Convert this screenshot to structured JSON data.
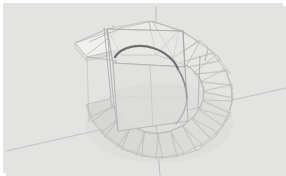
{
  "app": {
    "title": "3D Model Viewport",
    "view_label": "Spiral Staircase",
    "projection": "perspective",
    "shading": "shaded-wireframe"
  },
  "canvas": {
    "width": 286,
    "height": 176,
    "background_color": "#e3e3e1",
    "frame_color": "#ffffff",
    "frame_width": 3
  },
  "palette": {
    "tread_fill_light": "#ebebe9",
    "tread_fill_mid": "#e0e0de",
    "tread_fill_shadow": "#d6d6d4",
    "tread_edge": "#b9b9b7",
    "wireframe": "#a9a9ab",
    "wireframe_faint": "#c6c6c6",
    "axis_line": "#b4b4b6",
    "ground_line": "#bdbdbf",
    "handrail_dark": "#6e6e70"
  },
  "model": {
    "name": "helical-stair",
    "center_x": 152,
    "center_y": 82,
    "inner_radius": 34,
    "outer_radius": 84,
    "tread_count": 17,
    "start_angle_deg": -168,
    "sweep_deg": 330,
    "treads": [
      {
        "index": 1,
        "angle_deg": -170,
        "label": "tread-01",
        "fill": "#eeeeec"
      },
      {
        "index": 2,
        "angle_deg": -150,
        "label": "tread-02",
        "fill": "#ecece9"
      },
      {
        "index": 3,
        "angle_deg": -131,
        "label": "tread-03",
        "fill": "#ebebe8"
      },
      {
        "index": 4,
        "angle_deg": -112,
        "label": "tread-04",
        "fill": "#eaeae7"
      },
      {
        "index": 5,
        "angle_deg": -93,
        "label": "tread-05",
        "fill": "#e9e9e6"
      },
      {
        "index": 6,
        "angle_deg": -74,
        "label": "tread-06",
        "fill": "#e8e8e5"
      },
      {
        "index": 7,
        "angle_deg": -55,
        "label": "tread-07",
        "fill": "#e6e6e3"
      },
      {
        "index": 8,
        "angle_deg": -36,
        "label": "tread-08",
        "fill": "#e5e5e2"
      },
      {
        "index": 9,
        "angle_deg": -17,
        "label": "tread-09",
        "fill": "#e4e4e1"
      },
      {
        "index": 10,
        "angle_deg": 2,
        "label": "tread-10",
        "fill": "#e3e3e0"
      },
      {
        "index": 11,
        "angle_deg": 21,
        "label": "tread-11",
        "fill": "#e2e2df"
      },
      {
        "index": 12,
        "angle_deg": 40,
        "label": "tread-12",
        "fill": "#e1e1de"
      },
      {
        "index": 13,
        "angle_deg": 59,
        "label": "tread-13",
        "fill": "#e0e0dd"
      },
      {
        "index": 14,
        "angle_deg": 78,
        "label": "tread-14",
        "fill": "#dfdfdc"
      },
      {
        "index": 15,
        "angle_deg": 97,
        "label": "tread-15",
        "fill": "#dededb"
      },
      {
        "index": 16,
        "angle_deg": 116,
        "label": "tread-16",
        "fill": "#dddddA"
      },
      {
        "index": 17,
        "angle_deg": 135,
        "label": "tread-17",
        "fill": "#dcdcd9"
      }
    ],
    "column": {
      "name": "central-column",
      "radius": 32,
      "top_y": 52,
      "bottom_y": 118
    },
    "bounding_box": {
      "name": "column-bounding-box",
      "visible": true
    },
    "handrail": {
      "name": "handrail-arc",
      "visible": true,
      "color": "#6e6e70"
    },
    "axis": {
      "vertical_x": 152,
      "ground_slope": -0.115
    }
  }
}
